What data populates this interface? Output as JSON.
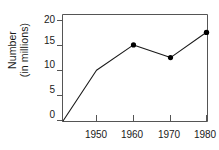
{
  "chart_data": {
    "type": "line",
    "title": "",
    "xlabel": "",
    "ylabel": "Number (in millions)",
    "ylabel_lines": [
      "Number",
      "(in millions)"
    ],
    "categories": [
      "1950",
      "1960",
      "1970",
      "1980"
    ],
    "x": [
      1950,
      1960,
      1970,
      1980
    ],
    "values": [
      10,
      15,
      12.5,
      17.5
    ],
    "series": [
      {
        "name": "Number (in millions)",
        "values": [
          10,
          15,
          12.5,
          17.5
        ]
      }
    ],
    "origin_point": {
      "x": 1940,
      "y": 0,
      "note": "line starts at axis origin"
    },
    "xlim": [
      1940,
      1985
    ],
    "ylim": [
      0,
      21
    ],
    "yticks": [
      "0",
      "5",
      "10",
      "15",
      "20"
    ],
    "ytick_values": [
      0,
      5,
      10,
      15,
      20
    ],
    "xticks": [
      "1950",
      "1960",
      "1970",
      "1980"
    ],
    "xtick_values": [
      1950,
      1960,
      1970,
      1980
    ],
    "grid": false,
    "legend": "none",
    "marker": "filled-circle",
    "line_color": "#1a1a1a",
    "marker_color": "#000000",
    "axis_color": "#555555",
    "background": "#ffffff"
  }
}
